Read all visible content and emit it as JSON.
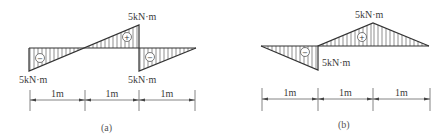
{
  "figures": [
    {
      "id": "a",
      "caption": "(a)",
      "baseline_y": 48,
      "x_start": 29,
      "x_end": 196,
      "points": [
        [
          29,
          48
        ],
        [
          29,
          71
        ],
        [
          139,
          25
        ],
        [
          139,
          71
        ],
        [
          196,
          48
        ]
      ],
      "zero_crossing_x": 84,
      "regions": [
        {
          "sign": "−",
          "polygon": [
            [
              29,
              48
            ],
            [
              29,
              71
            ],
            [
              84,
              48
            ]
          ],
          "sign_pos": [
            40,
            58
          ],
          "hatch_from": 30,
          "hatch_to": 84
        },
        {
          "sign": "+",
          "polygon": [
            [
              84,
              48
            ],
            [
              139,
              25
            ],
            [
              139,
              48
            ]
          ],
          "sign_pos": [
            127,
            37
          ],
          "hatch_from": 85,
          "hatch_to": 139
        },
        {
          "sign": "−",
          "polygon": [
            [
              139,
              48
            ],
            [
              139,
              71
            ],
            [
              196,
              48
            ]
          ],
          "sign_pos": [
            150,
            57
          ],
          "hatch_from": 140,
          "hatch_to": 196
        }
      ],
      "labels": [
        {
          "text": "5kN·m",
          "x": 128,
          "y": 20
        },
        {
          "text": "5kN·m",
          "x": 19,
          "y": 83
        },
        {
          "text": "5kN·m",
          "x": 128,
          "y": 83
        }
      ],
      "dimension": {
        "y": 100,
        "ticks_x": [
          30,
          85,
          139,
          195
        ],
        "tick_top": 90,
        "tick_bottom": 111,
        "segments": [
          "1m",
          "1m",
          "1m"
        ]
      },
      "caption_pos": [
        101,
        131
      ]
    },
    {
      "id": "b",
      "caption": "(b)",
      "baseline_y": 46,
      "x_start": 261,
      "x_end": 429,
      "points": [
        [
          261,
          46
        ],
        [
          318,
          70
        ],
        [
          318,
          46
        ],
        [
          373,
          23
        ],
        [
          429,
          46
        ]
      ],
      "regions": [
        {
          "sign": "−",
          "polygon": [
            [
              261,
              46
            ],
            [
              318,
              70
            ],
            [
              318,
              46
            ]
          ],
          "sign_pos": [
            305,
            52
          ],
          "hatch_from": 268,
          "hatch_to": 318
        },
        {
          "sign": "+",
          "polygon": [
            [
              318,
              46
            ],
            [
              373,
              23
            ],
            [
              373,
              46
            ]
          ],
          "sign_pos": [
            362,
            37
          ],
          "hatch_from": 319,
          "hatch_to": 373
        },
        {
          "sign": "",
          "polygon": [
            [
              373,
              23
            ],
            [
              429,
              46
            ],
            [
              373,
              46
            ]
          ],
          "sign_pos": null,
          "hatch_from": 374,
          "hatch_to": 426
        }
      ],
      "labels": [
        {
          "text": "5kN·m",
          "x": 355,
          "y": 18
        },
        {
          "text": "5kN·m",
          "x": 322,
          "y": 66
        }
      ],
      "dimension": {
        "y": 99,
        "ticks_x": [
          262,
          318,
          373,
          430
        ],
        "tick_top": 88,
        "tick_bottom": 111,
        "segments": [
          "1m",
          "1m",
          "1m"
        ]
      },
      "caption_pos": [
        338,
        128
      ]
    }
  ],
  "colors": {
    "line": "#333333",
    "background": "#ffffff"
  }
}
